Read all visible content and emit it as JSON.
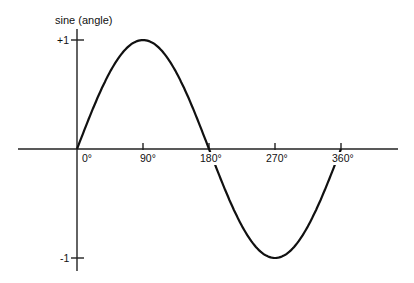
{
  "chart_data": {
    "type": "line",
    "title": "",
    "ylabel": "sine (angle)",
    "xlabel": "",
    "x_ticks": [
      "0°",
      "90°",
      "180°",
      "270°",
      "360°"
    ],
    "x_tick_values": [
      0,
      90,
      180,
      270,
      360
    ],
    "y_ticks": [
      "+1",
      "-1"
    ],
    "y_tick_values": [
      1,
      -1
    ],
    "xlim": [
      0,
      360
    ],
    "ylim": [
      -1,
      1
    ],
    "grid": false,
    "legend": null,
    "series": [
      {
        "name": "sine",
        "x": [
          0,
          45,
          90,
          135,
          180,
          225,
          270,
          315,
          360
        ],
        "y": [
          0,
          0.707,
          1,
          0.707,
          0,
          -0.707,
          -1,
          -0.707,
          0
        ]
      }
    ],
    "colors": {
      "line": "#111111",
      "axis": "#222222",
      "background": "#ffffff"
    }
  }
}
